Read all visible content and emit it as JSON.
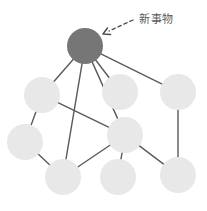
{
  "diagram": {
    "type": "node-link-network",
    "canvas": {
      "width": 207,
      "height": 211,
      "background": "#ffffff"
    },
    "colors": {
      "highlight_node": "#767676",
      "normal_node": "#e8e8e8",
      "edge": "#5a5a5a",
      "annotation_text": "#5a5a5a",
      "arrow": "#4f4f4f"
    },
    "annotation": {
      "label": "新事物",
      "label_x": 139,
      "label_y": 14,
      "font_size": 11,
      "arrow_style": "dashed",
      "arrow_from_x": 133,
      "arrow_from_y": 20,
      "arrow_to_x": 103,
      "arrow_to_y": 34,
      "points_to_node": "new-thing-node"
    },
    "nodes": [
      {
        "id": "new-thing-node",
        "name": "highlighted-new-thing-node",
        "x": 85,
        "y": 46,
        "r": 18,
        "fill": "#767676",
        "highlight": true
      },
      {
        "id": "n-left-upper",
        "name": "node-left-upper",
        "x": 42,
        "y": 95,
        "r": 18,
        "fill": "#e8e8e8",
        "highlight": false
      },
      {
        "id": "n-center-upper",
        "name": "node-center-upper",
        "x": 120,
        "y": 92,
        "r": 18,
        "fill": "#e8e8e8",
        "highlight": false
      },
      {
        "id": "n-right-upper",
        "name": "node-right-upper",
        "x": 178,
        "y": 92,
        "r": 18,
        "fill": "#e8e8e8",
        "highlight": false
      },
      {
        "id": "n-left-mid",
        "name": "node-left-mid",
        "x": 25,
        "y": 142,
        "r": 18,
        "fill": "#e8e8e8",
        "highlight": false
      },
      {
        "id": "n-center-mid",
        "name": "node-center-mid",
        "x": 125,
        "y": 135,
        "r": 18,
        "fill": "#e8e8e8",
        "highlight": false
      },
      {
        "id": "n-left-lower",
        "name": "node-left-lower",
        "x": 63,
        "y": 177,
        "r": 18,
        "fill": "#e8e8e8",
        "highlight": false
      },
      {
        "id": "n-center-lower",
        "name": "node-center-lower",
        "x": 118,
        "y": 177,
        "r": 18,
        "fill": "#e8e8e8",
        "highlight": false
      },
      {
        "id": "n-right-lower",
        "name": "node-right-lower",
        "x": 178,
        "y": 175,
        "r": 18,
        "fill": "#e8e8e8",
        "highlight": false
      }
    ],
    "edges": [
      {
        "from": "new-thing-node",
        "to": "n-left-upper",
        "width": 1.4
      },
      {
        "from": "new-thing-node",
        "to": "n-center-upper",
        "width": 1.4
      },
      {
        "from": "new-thing-node",
        "to": "n-right-upper",
        "width": 1.4
      },
      {
        "from": "new-thing-node",
        "to": "n-left-lower",
        "width": 1.4
      },
      {
        "from": "new-thing-node",
        "to": "n-center-mid",
        "width": 1.4
      },
      {
        "from": "n-left-upper",
        "to": "n-left-mid",
        "width": 1.4
      },
      {
        "from": "n-left-upper",
        "to": "n-center-mid",
        "width": 1.4
      },
      {
        "from": "n-left-mid",
        "to": "n-left-lower",
        "width": 1.4
      },
      {
        "from": "n-right-upper",
        "to": "n-right-lower",
        "width": 1.4
      },
      {
        "from": "n-center-mid",
        "to": "n-left-lower",
        "width": 1.4
      },
      {
        "from": "n-center-mid",
        "to": "n-center-lower",
        "width": 1.4
      },
      {
        "from": "n-center-mid",
        "to": "n-right-lower",
        "width": 1.4
      }
    ]
  }
}
